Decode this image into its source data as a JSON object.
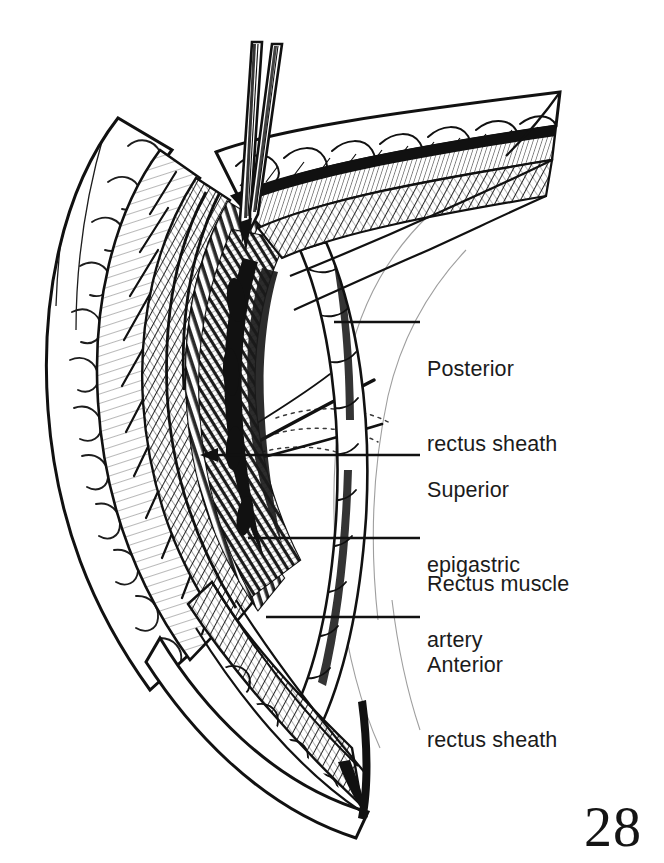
{
  "figure": {
    "kind": "surgical-anatomical-illustration",
    "style": "black-and-white pen-and-ink line drawing with cross-hatching",
    "background_color": "#ffffff",
    "ink_color": "#111111"
  },
  "labels": [
    {
      "id": "posterior-rectus-sheath",
      "line1": "Posterior",
      "line2": "rectus sheath",
      "leader": {
        "from_x": 334,
        "from_y": 322,
        "to_x": 420,
        "to_y": 322
      }
    },
    {
      "id": "superior-epigastric-artery",
      "line1": "Superior",
      "line2": "epigastric",
      "line3": "artery",
      "leader": {
        "from_x": 205,
        "from_y": 455,
        "to_x": 420,
        "to_y": 455,
        "arrowhead": true
      }
    },
    {
      "id": "rectus-muscle",
      "line1": "Rectus muscle",
      "leader": {
        "from_x": 248,
        "from_y": 538,
        "to_x": 420,
        "to_y": 538
      }
    },
    {
      "id": "anterior-rectus-sheath",
      "line1": "Anterior",
      "line2": "rectus sheath",
      "leader": {
        "from_x": 266,
        "from_y": 617,
        "to_x": 420,
        "to_y": 617
      }
    }
  ],
  "instrument": {
    "name": "surgical-scissors",
    "description": "two parallel blades entering the incision from above",
    "tip_x": 243,
    "tip_y": 238
  },
  "page": {
    "number": "28"
  },
  "anatomy_layers": [
    "skin and subcutaneous fat",
    "anterior rectus sheath",
    "rectus abdominis muscle",
    "posterior rectus sheath",
    "superior epigastric artery"
  ]
}
